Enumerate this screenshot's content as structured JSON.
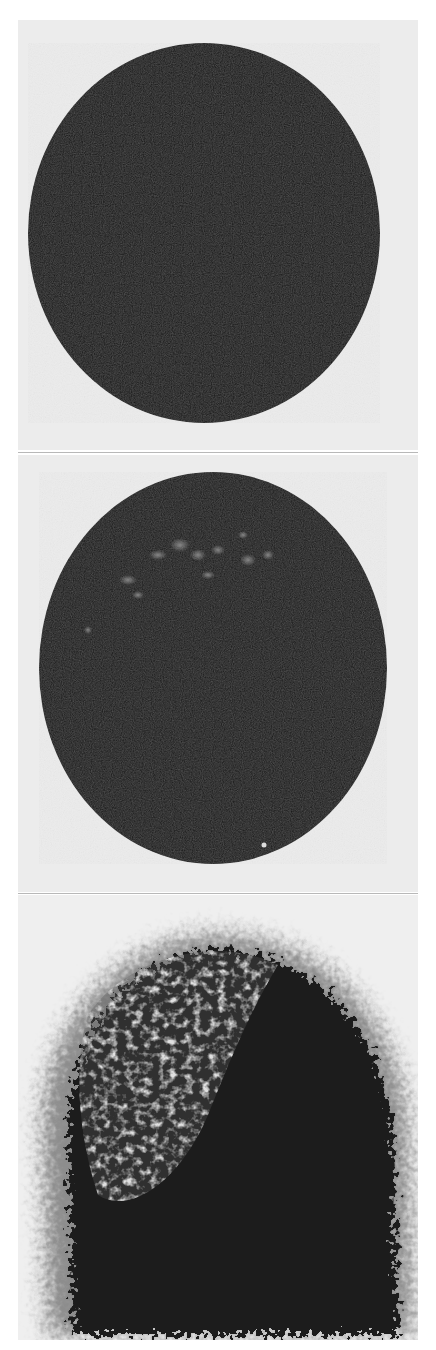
{
  "figure": {
    "panels": [
      {
        "id": "top",
        "description": "solid dark circular disc",
        "fill": "#161616",
        "background": "#ececec"
      },
      {
        "id": "middle",
        "description": "dark circular disc with faint light speckles near top",
        "fill": "#171717",
        "background": "#ececec"
      },
      {
        "id": "bottom",
        "description": "diffuse noisy dark blob with mottled lighter upper-left region",
        "fill": "#1a1a1a",
        "background": "#efefef"
      }
    ]
  }
}
